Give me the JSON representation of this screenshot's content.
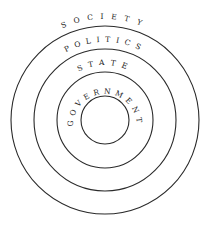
{
  "diagram": {
    "type": "concentric-circles",
    "center": {
      "x": 105,
      "y": 120
    },
    "stroke_color": "#2a2a2a",
    "text_color": "#222222",
    "rings": [
      {
        "label": "SOCIETY",
        "radius": 94,
        "label_radius": 101
      },
      {
        "label": "POLITICS",
        "radius": 71,
        "label_radius": 78
      },
      {
        "label": "STATE",
        "radius": 48,
        "label_radius": 55
      },
      {
        "label": "GOVERNMENT",
        "radius": 24,
        "label_radius": 32
      }
    ]
  }
}
